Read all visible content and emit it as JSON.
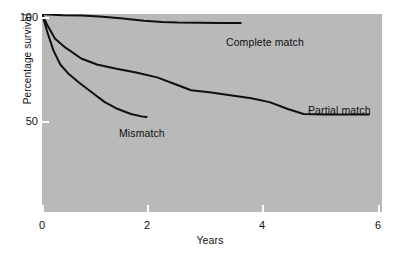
{
  "figure": {
    "background_color": "#ffffff",
    "panel_color": "#b9b9b9",
    "line_color": "#101010"
  },
  "axes": {
    "y": {
      "title": "Percentage survival",
      "tick_labels": [
        "100",
        "50"
      ],
      "tick_values": [
        100,
        50
      ],
      "range": [
        0,
        100
      ]
    },
    "x": {
      "title": "Years",
      "tick_labels": [
        "0",
        "2",
        "4",
        "6"
      ],
      "tick_values": [
        0,
        2,
        4,
        6
      ],
      "range": [
        0,
        6.5
      ]
    }
  },
  "series_labels": {
    "complete_match": "Complete match",
    "partial_match": "Partial match",
    "mismatch": "Mismatch"
  },
  "chart_data": {
    "type": "line",
    "title": "",
    "subtitle": "",
    "xlabel": "Years",
    "ylabel": "Percentage survival",
    "xlim": [
      0,
      6.5
    ],
    "ylim": [
      0,
      100
    ],
    "xticks": [
      0,
      2,
      4,
      6
    ],
    "yticks": [
      50,
      100
    ],
    "grid": false,
    "legend": "inline-annotations",
    "annotations": [
      {
        "text": "Complete match",
        "x": 3.55,
        "y": 89
      },
      {
        "text": "Partial match",
        "x": 5.15,
        "y": 55
      },
      {
        "text": "Mismatch",
        "x": 1.5,
        "y": 43
      }
    ],
    "series": [
      {
        "name": "Complete match",
        "label": "Complete match",
        "color": "#101010",
        "x": [
          0.0,
          0.12,
          0.4,
          0.75,
          1.1,
          1.5,
          1.95,
          2.3,
          2.6,
          3.0,
          3.4,
          3.8
        ],
        "y": [
          100,
          99.7,
          99.4,
          99.3,
          98.7,
          97.8,
          96.6,
          96.0,
          95.7,
          95.6,
          95.5,
          95.4
        ]
      },
      {
        "name": "Partial match",
        "label": "Partial match",
        "color": "#101010",
        "x": [
          0.0,
          0.1,
          0.25,
          0.45,
          0.75,
          1.05,
          1.4,
          1.8,
          2.2,
          2.55,
          2.85,
          3.2,
          3.6,
          4.0,
          4.35,
          4.7,
          5.0,
          5.4,
          5.9,
          6.25
        ],
        "y": [
          100,
          94.5,
          87.5,
          83.0,
          77.5,
          74.5,
          72.5,
          70.5,
          68.0,
          64.5,
          61.5,
          60.5,
          59.0,
          57.5,
          55.5,
          52.0,
          49.5,
          49.3,
          49.2,
          49.2
        ]
      },
      {
        "name": "Mismatch",
        "label": "Mismatch",
        "color": "#101010",
        "x": [
          0.0,
          0.1,
          0.22,
          0.35,
          0.5,
          0.7,
          0.95,
          1.2,
          1.45,
          1.7,
          1.9,
          2.0
        ],
        "y": [
          100,
          91.0,
          81.5,
          74.5,
          70.0,
          65.5,
          60.5,
          55.5,
          52.0,
          49.5,
          48.3,
          48.0
        ]
      }
    ]
  }
}
